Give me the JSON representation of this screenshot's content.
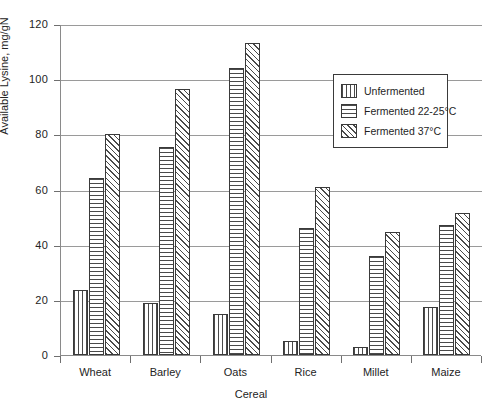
{
  "chart_data": {
    "type": "bar",
    "title": "",
    "xlabel": "Cereal",
    "ylabel": "Available Lysine, mg/gN",
    "ylim": [
      0,
      120
    ],
    "yticks": [
      0,
      20,
      40,
      60,
      80,
      100,
      120
    ],
    "grid": true,
    "legend_position": "inside-upper-right",
    "categories": [
      "Wheat",
      "Barley",
      "Oats",
      "Rice",
      "Millet",
      "Maize"
    ],
    "series": [
      {
        "name": "Unfermented",
        "pattern": "vertical-lines",
        "values": [
          23.5,
          19,
          15,
          5,
          3,
          17.5
        ]
      },
      {
        "name": "Fermented 22-25°C",
        "pattern": "horizontal-lines",
        "values": [
          64,
          75.5,
          104,
          46,
          36,
          47
        ]
      },
      {
        "name": "Fermented 37°C",
        "pattern": "diagonal-hatch",
        "values": [
          80,
          96.5,
          113,
          61,
          44.5,
          51.5
        ]
      }
    ]
  },
  "colors": {
    "background": "#ffffff",
    "axis": "#8a8a8a",
    "gridline": "#9a9a9a",
    "bar_outline": "#3a3a3a",
    "bar_fill": "#ffffff",
    "hatch": "#4a4a4a",
    "text": "#242424"
  }
}
